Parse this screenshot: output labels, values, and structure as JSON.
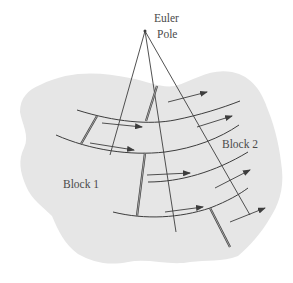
{
  "figure": {
    "pole_label_line1": "Euler",
    "pole_label_line2": "Pole",
    "block1_label": "Block 1",
    "block2_label": "Block 2"
  },
  "colors": {
    "background": "#ffffff",
    "block_fill": "#e6e6e6",
    "line": "#3d3d3d",
    "text": "#4a4a4a"
  },
  "elements": {
    "euler_pole": {
      "x": 145,
      "y": 31
    },
    "great_circles_from_pole": 3,
    "small_circle_arcs": 4,
    "double_line_faults": 4,
    "motion_arrows": 8
  }
}
